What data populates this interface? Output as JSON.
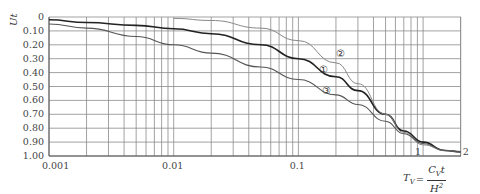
{
  "chart_data": {
    "type": "line",
    "title": "",
    "xlabel": "T_V = C_V t / H^2",
    "xlabel_parts": {
      "lhs": "T",
      "lhs_sub": "V",
      "num": "C",
      "num_sub": "V",
      "num_tail": "t",
      "den": "H",
      "den_sup": "2"
    },
    "ylabel": "U_t",
    "xscale": "log",
    "xlim": [
      0.001,
      2
    ],
    "ylim": [
      0,
      1.0
    ],
    "y_inverted": true,
    "grid": true,
    "x_tick_labels": [
      "0.001",
      "0.01",
      "0.1",
      "1",
      "2"
    ],
    "x_ticks": [
      0.001,
      0.01,
      0.1,
      1,
      2
    ],
    "y_tick_labels": [
      "0",
      "0.10",
      "0.20",
      "0.30",
      "0.40",
      "0.50",
      "0.60",
      "0.70",
      "0.80",
      "0.90",
      "1.00"
    ],
    "y_ticks": [
      0,
      0.1,
      0.2,
      0.3,
      0.4,
      0.5,
      0.6,
      0.7,
      0.8,
      0.9,
      1.0
    ],
    "series": [
      {
        "name": "①",
        "color": "#222222",
        "x": [
          0.001,
          0.002,
          0.005,
          0.01,
          0.02,
          0.05,
          0.1,
          0.2,
          0.3,
          0.5,
          0.7,
          1.0,
          1.5,
          2.0
        ],
        "values": [
          0.02,
          0.04,
          0.06,
          0.085,
          0.12,
          0.2,
          0.3,
          0.43,
          0.53,
          0.7,
          0.82,
          0.9,
          0.96,
          0.97
        ]
      },
      {
        "name": "②",
        "color": "#888888",
        "x": [
          0.01,
          0.02,
          0.05,
          0.1,
          0.2,
          0.3,
          0.5,
          0.7,
          1.0,
          1.5,
          2.0
        ],
        "values": [
          0.01,
          0.025,
          0.08,
          0.17,
          0.33,
          0.48,
          0.7,
          0.83,
          0.92,
          0.96,
          0.97
        ]
      },
      {
        "name": "③",
        "color": "#555555",
        "x": [
          0.001,
          0.002,
          0.005,
          0.01,
          0.02,
          0.05,
          0.1,
          0.2,
          0.3,
          0.5,
          0.7,
          1.0,
          1.5,
          2.0
        ],
        "values": [
          0.05,
          0.08,
          0.14,
          0.2,
          0.26,
          0.36,
          0.45,
          0.56,
          0.63,
          0.75,
          0.84,
          0.91,
          0.96,
          0.97
        ]
      }
    ],
    "annotations": [
      {
        "text": "②",
        "x": 0.22,
        "y": 0.27
      },
      {
        "text": "①",
        "x": 0.16,
        "y": 0.39
      },
      {
        "text": "③",
        "x": 0.17,
        "y": 0.54
      }
    ]
  }
}
